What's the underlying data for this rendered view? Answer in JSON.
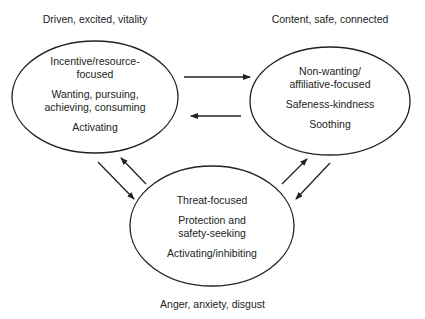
{
  "diagram": {
    "nodes": [
      {
        "id": "drive",
        "caption": "Driven, excited, vitality",
        "lines": [
          "Incentive/resource-",
          "focused"
        ],
        "lines2": [
          "Wanting, pursuing,",
          "achieving, consuming"
        ],
        "lines3": [
          "Activating"
        ]
      },
      {
        "id": "soothe",
        "caption": "Content, safe, connected",
        "lines": [
          "Non-wanting/",
          "affiliative-focused"
        ],
        "lines2": [
          "Safeness-kindness"
        ],
        "lines3": [
          "Soothing"
        ]
      },
      {
        "id": "threat",
        "caption": "Anger, anxiety, disgust",
        "lines": [
          "Threat-focused"
        ],
        "lines2": [
          "Protection and",
          "safety-seeking"
        ],
        "lines3": [
          "Activating/inhibiting"
        ]
      }
    ],
    "edges": [
      {
        "from": "drive",
        "to": "soothe"
      },
      {
        "from": "soothe",
        "to": "drive"
      },
      {
        "from": "drive",
        "to": "threat"
      },
      {
        "from": "threat",
        "to": "drive"
      },
      {
        "from": "threat",
        "to": "soothe"
      },
      {
        "from": "soothe",
        "to": "threat"
      }
    ],
    "colors": {
      "stroke": "#222222",
      "background": "#ffffff"
    }
  }
}
